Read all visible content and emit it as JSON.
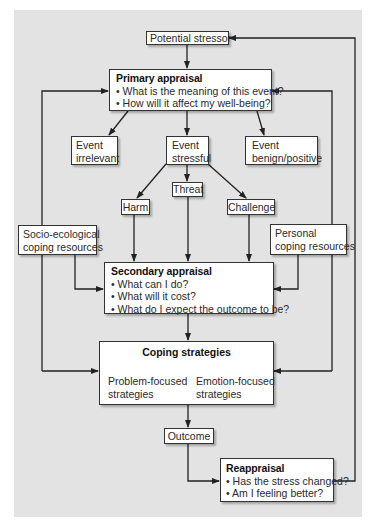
{
  "diagram": {
    "nodes": {
      "potential_stressor": {
        "label": "Potential stressor"
      },
      "primary_appraisal": {
        "title": "Primary appraisal",
        "bullets": [
          "What is the meaning of this event?",
          "How will it affect my well-being?"
        ]
      },
      "event_irrelevant": {
        "line1": "Event",
        "line2": "irrelevant"
      },
      "event_stressful": {
        "line1": "Event",
        "line2": "stressful"
      },
      "event_benign": {
        "line1": "Event",
        "line2": "benign/positive"
      },
      "threat": {
        "label": "Threat"
      },
      "harm": {
        "label": "Harm"
      },
      "challenge": {
        "label": "Challenge"
      },
      "socio_ecological": {
        "line1": "Socio-ecological",
        "line2": "coping resources"
      },
      "personal": {
        "line1": "Personal",
        "line2": "coping resources"
      },
      "secondary_appraisal": {
        "title": "Secondary appraisal",
        "bullets": [
          "What can I do?",
          "What will it cost?",
          "What do I expect the outcome to be?"
        ]
      },
      "coping_strategies": {
        "title": "Coping strategies",
        "problem": {
          "line1": "Problem-focused",
          "line2": "strategies"
        },
        "emotion": {
          "line1": "Emotion-focused",
          "line2": "strategies"
        }
      },
      "outcome": {
        "label": "Outcome"
      },
      "reappraisal": {
        "title": "Reappraisal",
        "bullets": [
          "Has the stress changed?",
          "Am I feeling better?"
        ]
      }
    },
    "colors": {
      "background": "#e3e3e3",
      "box": "#ffffff",
      "line": "#222222"
    }
  }
}
